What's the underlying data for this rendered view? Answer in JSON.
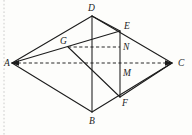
{
  "figure": {
    "background_color": "#fdfdfb",
    "stroke_color": "#1c1c1c",
    "margin_guide_color": "#b9b9b9",
    "vertices": {
      "A": {
        "label": "A",
        "x": 12,
        "y": 63,
        "label_x": 4,
        "label_y": 66
      },
      "B": {
        "label": "B",
        "x": 92,
        "y": 112,
        "label_x": 89,
        "label_y": 124
      },
      "C": {
        "label": "C",
        "x": 172,
        "y": 63,
        "label_x": 178,
        "label_y": 66
      },
      "D": {
        "label": "D",
        "x": 92,
        "y": 16,
        "label_x": 88,
        "label_y": 11
      },
      "E": {
        "label": "E",
        "x": 120,
        "y": 31,
        "label_x": 124,
        "label_y": 29
      },
      "F": {
        "label": "F",
        "x": 120,
        "y": 97,
        "label_x": 122,
        "label_y": 106
      },
      "G": {
        "label": "G",
        "x": 68,
        "y": 47,
        "label_x": 60,
        "label_y": 44
      },
      "M": {
        "label": "M",
        "x": 120,
        "y": 71,
        "label_x": 123,
        "label_y": 76
      },
      "N": {
        "label": "N",
        "x": 120,
        "y": 47,
        "label_x": 123,
        "label_y": 50
      }
    },
    "solid_edges": [
      {
        "name": "edge-A-D",
        "from": "A",
        "to": "D"
      },
      {
        "name": "edge-D-C",
        "from": "D",
        "to": "C"
      },
      {
        "name": "edge-A-B",
        "from": "A",
        "to": "B"
      },
      {
        "name": "edge-B-C",
        "from": "B",
        "to": "C"
      },
      {
        "name": "edge-D-B",
        "from": "D",
        "to": "B"
      },
      {
        "name": "edge-A-E",
        "from": "A",
        "to": "E"
      },
      {
        "name": "edge-D-E",
        "from": "D",
        "to": "E"
      },
      {
        "name": "edge-E-F",
        "from": "E",
        "to": "F"
      },
      {
        "name": "edge-G-F",
        "from": "G",
        "to": "F"
      },
      {
        "name": "edge-F-C",
        "from": "F",
        "to": "C"
      }
    ],
    "dashed_edges": [
      {
        "name": "edge-A-C-dashed",
        "from": "A",
        "to": "C"
      },
      {
        "name": "edge-G-N-dashed",
        "from": "G",
        "to": "N"
      }
    ],
    "arrow_markers": [
      {
        "name": "arrow-at-A",
        "at": "A"
      },
      {
        "name": "arrow-at-C",
        "at": "C"
      }
    ],
    "margin_guide": {
      "name": "page-margin-guide",
      "x": 4,
      "y1": 0,
      "y2": 135
    }
  }
}
